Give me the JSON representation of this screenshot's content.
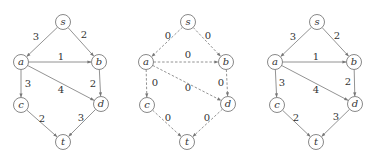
{
  "graphs": [
    {
      "id": "graph-1",
      "style": "solid",
      "offset_x": 0,
      "nodes": [
        {
          "id": "s",
          "label": "s",
          "x": 63,
          "y": 22
        },
        {
          "id": "a",
          "label": "a",
          "x": 21,
          "y": 62
        },
        {
          "id": "b",
          "label": "b",
          "x": 99,
          "y": 62
        },
        {
          "id": "c",
          "label": "c",
          "x": 21,
          "y": 105
        },
        {
          "id": "d",
          "label": "d",
          "x": 101,
          "y": 104
        },
        {
          "id": "t",
          "label": "t",
          "x": 63,
          "y": 142
        }
      ],
      "edges": [
        {
          "from": "s",
          "to": "a",
          "label": "3",
          "lx": 36,
          "ly": 37
        },
        {
          "from": "s",
          "to": "b",
          "label": "2",
          "lx": 84,
          "ly": 35
        },
        {
          "from": "a",
          "to": "b",
          "label": "1",
          "lx": 61,
          "ly": 57
        },
        {
          "from": "a",
          "to": "c",
          "label": "3",
          "lx": 28,
          "ly": 84
        },
        {
          "from": "a",
          "to": "d",
          "label": "4",
          "lx": 61,
          "ly": 90
        },
        {
          "from": "b",
          "to": "d",
          "label": "2",
          "lx": 93,
          "ly": 84
        },
        {
          "from": "c",
          "to": "t",
          "label": "2",
          "lx": 42,
          "ly": 119
        },
        {
          "from": "d",
          "to": "t",
          "label": "3",
          "lx": 81,
          "ly": 118
        }
      ]
    },
    {
      "id": "graph-2",
      "style": "dashed",
      "offset_x": 0,
      "nodes": [
        {
          "id": "s",
          "label": "s",
          "x": 188,
          "y": 22
        },
        {
          "id": "a",
          "label": "a",
          "x": 146,
          "y": 62
        },
        {
          "id": "b",
          "label": "b",
          "x": 226,
          "y": 62
        },
        {
          "id": "c",
          "label": "c",
          "x": 147,
          "y": 105
        },
        {
          "id": "d",
          "label": "d",
          "x": 228,
          "y": 104
        },
        {
          "id": "t",
          "label": "t",
          "x": 187,
          "y": 142
        }
      ],
      "edges": [
        {
          "from": "s",
          "to": "a",
          "label": "0",
          "lx": 168,
          "ly": 36
        },
        {
          "from": "s",
          "to": "b",
          "label": "0",
          "lx": 208,
          "ly": 36
        },
        {
          "from": "a",
          "to": "b",
          "label": "0",
          "lx": 188,
          "ly": 55
        },
        {
          "from": "a",
          "to": "c",
          "label": "0",
          "lx": 155,
          "ly": 83
        },
        {
          "from": "a",
          "to": "d",
          "label": "0",
          "lx": 188,
          "ly": 88
        },
        {
          "from": "b",
          "to": "d",
          "label": "0",
          "lx": 221,
          "ly": 83
        },
        {
          "from": "c",
          "to": "t",
          "label": "0",
          "lx": 168,
          "ly": 118
        },
        {
          "from": "d",
          "to": "t",
          "label": "0",
          "lx": 207,
          "ly": 118
        }
      ]
    },
    {
      "id": "graph-3",
      "style": "solid",
      "offset_x": 0,
      "nodes": [
        {
          "id": "s",
          "label": "s",
          "x": 317,
          "y": 22
        },
        {
          "id": "a",
          "label": "a",
          "x": 275,
          "y": 62
        },
        {
          "id": "b",
          "label": "b",
          "x": 354,
          "y": 62
        },
        {
          "id": "c",
          "label": "c",
          "x": 277,
          "y": 105
        },
        {
          "id": "d",
          "label": "d",
          "x": 355,
          "y": 104
        },
        {
          "id": "t",
          "label": "t",
          "x": 316,
          "y": 142
        }
      ],
      "edges": [
        {
          "from": "s",
          "to": "a",
          "label": "3",
          "lx": 293,
          "ly": 37
        },
        {
          "from": "s",
          "to": "b",
          "label": "2",
          "lx": 337,
          "ly": 36
        },
        {
          "from": "a",
          "to": "b",
          "label": "1",
          "lx": 316,
          "ly": 57
        },
        {
          "from": "a",
          "to": "c",
          "label": "3",
          "lx": 282,
          "ly": 83
        },
        {
          "from": "a",
          "to": "d",
          "label": "4",
          "lx": 316,
          "ly": 90
        },
        {
          "from": "b",
          "to": "d",
          "label": "2",
          "lx": 348,
          "ly": 82
        },
        {
          "from": "c",
          "to": "t",
          "label": "2",
          "lx": 296,
          "ly": 118
        },
        {
          "from": "d",
          "to": "t",
          "label": "3",
          "lx": 336,
          "ly": 117
        }
      ]
    }
  ],
  "colors": {
    "node_stroke": "#6a6a6a",
    "edge": "#777777",
    "text": "#333333",
    "background": "#ffffff"
  }
}
